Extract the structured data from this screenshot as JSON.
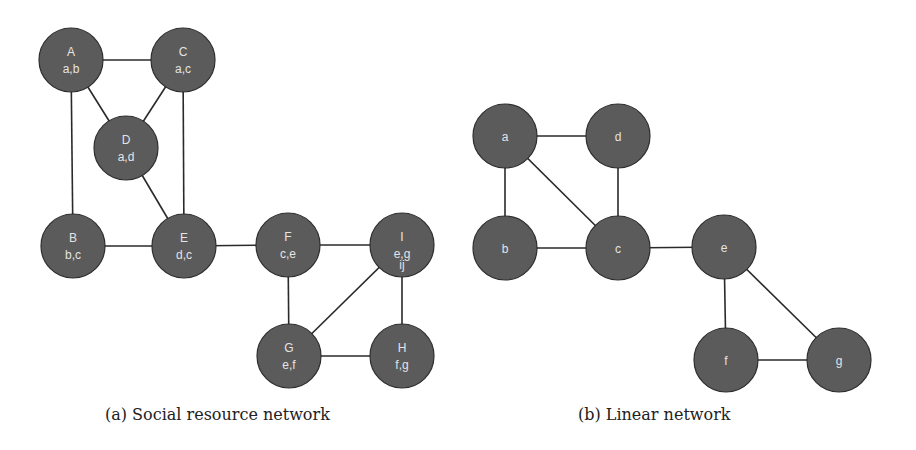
{
  "figure": {
    "panels": [
      {
        "id": "a",
        "caption": "(a) Social resource network",
        "nodes": [
          {
            "id": "A",
            "label": "A",
            "sub": "a,b",
            "x": 71,
            "y": 60
          },
          {
            "id": "C",
            "label": "C",
            "sub": "a,c",
            "x": 183,
            "y": 60
          },
          {
            "id": "D",
            "label": "D",
            "sub": "a,d",
            "x": 126,
            "y": 148
          },
          {
            "id": "B",
            "label": "B",
            "sub": "b,c",
            "x": 73,
            "y": 246
          },
          {
            "id": "E",
            "label": "E",
            "sub": "d,c",
            "x": 184,
            "y": 246
          },
          {
            "id": "F",
            "label": "F",
            "sub": "c,e",
            "x": 288,
            "y": 245
          },
          {
            "id": "I",
            "label": "I",
            "sub": "e,g",
            "extra": "ij",
            "x": 402,
            "y": 245
          },
          {
            "id": "G",
            "label": "G",
            "sub": "e,f",
            "x": 289,
            "y": 356
          },
          {
            "id": "H",
            "label": "H",
            "sub": "f,g",
            "x": 402,
            "y": 356
          }
        ],
        "edges": [
          [
            "A",
            "C"
          ],
          [
            "A",
            "D"
          ],
          [
            "A",
            "B"
          ],
          [
            "C",
            "D"
          ],
          [
            "C",
            "E"
          ],
          [
            "D",
            "E"
          ],
          [
            "B",
            "E"
          ],
          [
            "E",
            "F"
          ],
          [
            "F",
            "I"
          ],
          [
            "F",
            "G"
          ],
          [
            "G",
            "I"
          ],
          [
            "I",
            "H"
          ],
          [
            "G",
            "H"
          ]
        ]
      },
      {
        "id": "b",
        "caption": "(b) Linear network",
        "nodes": [
          {
            "id": "a",
            "label": "a",
            "x": 505,
            "y": 136
          },
          {
            "id": "d",
            "label": "d",
            "x": 618,
            "y": 136
          },
          {
            "id": "b",
            "label": "b",
            "x": 505,
            "y": 248
          },
          {
            "id": "c",
            "label": "c",
            "x": 618,
            "y": 248,
            "highlight": true
          },
          {
            "id": "e",
            "label": "e",
            "x": 724,
            "y": 247
          },
          {
            "id": "f",
            "label": "f",
            "x": 726,
            "y": 360
          },
          {
            "id": "g",
            "label": "g",
            "x": 839,
            "y": 360
          }
        ],
        "edges": [
          [
            "a",
            "d"
          ],
          [
            "a",
            "b"
          ],
          [
            "a",
            "c"
          ],
          [
            "d",
            "c"
          ],
          [
            "b",
            "c"
          ],
          [
            "c",
            "e"
          ],
          [
            "e",
            "f"
          ],
          [
            "e",
            "g"
          ],
          [
            "f",
            "g"
          ]
        ]
      }
    ],
    "node_radius": 32,
    "colors": {
      "node_fill": "#5b5b5b",
      "node_stroke": "#2e2e2e",
      "edge": "#2a2a2a",
      "text": "#e4e4e4"
    }
  }
}
